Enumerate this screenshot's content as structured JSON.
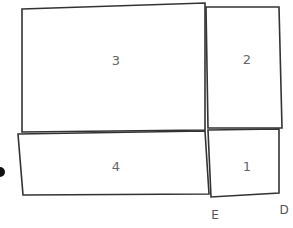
{
  "diagram": {
    "stroke_color": "#333333",
    "label_color": "#666666",
    "shapes": [
      {
        "id": "1",
        "label": "1",
        "points": "208,130 279,129 279,193 211,197",
        "label_pos": [
          247,
          167
        ]
      },
      {
        "id": "2",
        "label": "2",
        "points": "206,7 279,7 282,128 208,128",
        "label_pos": [
          247,
          60
        ]
      },
      {
        "id": "3",
        "label": "3",
        "points": "22,9 205,3 205,130 22,132",
        "label_pos": [
          116,
          61
        ]
      },
      {
        "id": "4",
        "label": "4",
        "points": "18,134 205,131 209,194 23,195",
        "label_pos": [
          116,
          167
        ]
      }
    ],
    "vertex_labels": [
      {
        "id": "E",
        "label": "E",
        "pos": [
          215,
          215
        ]
      },
      {
        "id": "D",
        "label": "D",
        "pos": [
          284,
          210
        ]
      }
    ],
    "dot": {
      "cx": 0,
      "cy": 172,
      "r": 5
    }
  }
}
